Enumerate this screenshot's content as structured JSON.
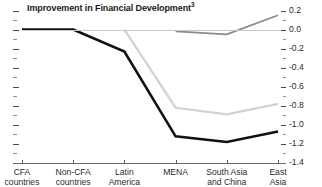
{
  "chart_data": {
    "type": "line",
    "title": "Improvement in Financial Development",
    "title_superscript": "3",
    "xlabel": "",
    "ylabel": "Real GDP per capita growth rate volatility",
    "categories": [
      "CFA countries",
      "Non-CFA countries",
      "Latin America",
      "MENA",
      "South Asia and China",
      "East Asia"
    ],
    "category_lines": [
      [
        "CFA",
        "countries"
      ],
      [
        "Non-CFA",
        "countries"
      ],
      [
        "Latin",
        "America"
      ],
      [
        "MENA",
        ""
      ],
      [
        "South Asia",
        "and China"
      ],
      [
        "East",
        "Asia"
      ]
    ],
    "ylim": [
      -1.4,
      0.2
    ],
    "ytick_labels": [
      "0.2",
      "0.0",
      "-0.2",
      "-0.4",
      "-0.6",
      "-0.8",
      "-1.0",
      "-1.2",
      "-1.4"
    ],
    "ytick_values": [
      0.2,
      0.0,
      -0.2,
      -0.4,
      -0.6,
      -0.8,
      -1.0,
      -1.2,
      -1.4
    ],
    "yminor_step": 0.1,
    "grid": false,
    "legend": "none",
    "axis_position": "right",
    "series": [
      {
        "name": "dark",
        "color": "#111111",
        "width": 2.6,
        "values": [
          0.0,
          0.0,
          -0.23,
          -1.12,
          -1.18,
          -1.07
        ]
      },
      {
        "name": "light-gray",
        "color": "#d2d2d2",
        "width": 2.2,
        "values": [
          null,
          null,
          0.0,
          -0.82,
          -0.89,
          -0.78
        ]
      },
      {
        "name": "mid-gray",
        "color": "#8a8a8a",
        "width": 1.8,
        "values": [
          null,
          null,
          null,
          -0.02,
          -0.05,
          0.15
        ]
      }
    ]
  },
  "colors": {
    "axis": "#5a5a5a",
    "text": "#2b2b2b",
    "title": "#1a1a1a",
    "zeroline": "#c9c9c9",
    "background": "#ffffff"
  }
}
